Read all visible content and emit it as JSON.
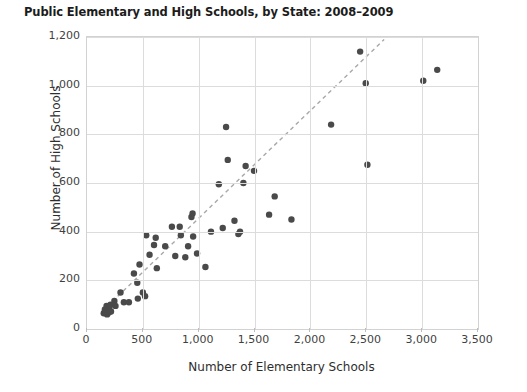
{
  "chart_data": {
    "type": "scatter",
    "title": "Public Elementary and High Schools, by State: 2008–2009",
    "xlabel": "Number of Elementary Schools",
    "ylabel": "Number of High Schools",
    "xlim": [
      0,
      3500
    ],
    "ylim": [
      0,
      1200
    ],
    "xticks": [
      0,
      500,
      1000,
      1500,
      2000,
      2500,
      3000,
      3500
    ],
    "xtick_labels": [
      "0",
      "500",
      "1,000",
      "1,500",
      "2,000",
      "2,500",
      "3,000",
      "3,500"
    ],
    "yticks": [
      0,
      200,
      400,
      600,
      800,
      1000,
      1200
    ],
    "ytick_labels": [
      "0",
      "200",
      "400",
      "600",
      "800",
      "1,000",
      "1,200"
    ],
    "grid": true,
    "legend": "none",
    "marker_color": "#4a4a4a",
    "marker_size": 6,
    "trendline": {
      "style": "dashed",
      "color": "#a8a8a8",
      "x_start": 130,
      "y_start": 70,
      "x_end": 2660,
      "y_end": 1190
    },
    "points": [
      {
        "x": 150,
        "y": 65
      },
      {
        "x": 160,
        "y": 80
      },
      {
        "x": 170,
        "y": 70
      },
      {
        "x": 175,
        "y": 95
      },
      {
        "x": 180,
        "y": 60
      },
      {
        "x": 185,
        "y": 78
      },
      {
        "x": 195,
        "y": 68
      },
      {
        "x": 200,
        "y": 90
      },
      {
        "x": 210,
        "y": 100
      },
      {
        "x": 215,
        "y": 72
      },
      {
        "x": 245,
        "y": 115
      },
      {
        "x": 255,
        "y": 95
      },
      {
        "x": 300,
        "y": 150
      },
      {
        "x": 330,
        "y": 110
      },
      {
        "x": 375,
        "y": 110
      },
      {
        "x": 420,
        "y": 228
      },
      {
        "x": 450,
        "y": 190
      },
      {
        "x": 455,
        "y": 125
      },
      {
        "x": 470,
        "y": 265
      },
      {
        "x": 500,
        "y": 150
      },
      {
        "x": 520,
        "y": 135
      },
      {
        "x": 530,
        "y": 385
      },
      {
        "x": 560,
        "y": 305
      },
      {
        "x": 600,
        "y": 345
      },
      {
        "x": 615,
        "y": 375
      },
      {
        "x": 625,
        "y": 250
      },
      {
        "x": 700,
        "y": 340
      },
      {
        "x": 760,
        "y": 420
      },
      {
        "x": 790,
        "y": 300
      },
      {
        "x": 830,
        "y": 420
      },
      {
        "x": 840,
        "y": 385
      },
      {
        "x": 880,
        "y": 295
      },
      {
        "x": 905,
        "y": 340
      },
      {
        "x": 935,
        "y": 460
      },
      {
        "x": 945,
        "y": 475
      },
      {
        "x": 950,
        "y": 380
      },
      {
        "x": 985,
        "y": 310
      },
      {
        "x": 1060,
        "y": 255
      },
      {
        "x": 1110,
        "y": 400
      },
      {
        "x": 1180,
        "y": 595
      },
      {
        "x": 1215,
        "y": 415
      },
      {
        "x": 1245,
        "y": 830
      },
      {
        "x": 1260,
        "y": 695
      },
      {
        "x": 1320,
        "y": 445
      },
      {
        "x": 1355,
        "y": 390
      },
      {
        "x": 1370,
        "y": 400
      },
      {
        "x": 1400,
        "y": 600
      },
      {
        "x": 1420,
        "y": 670
      },
      {
        "x": 1495,
        "y": 650
      },
      {
        "x": 1630,
        "y": 470
      },
      {
        "x": 1680,
        "y": 545
      },
      {
        "x": 1830,
        "y": 450
      },
      {
        "x": 2185,
        "y": 840
      },
      {
        "x": 2445,
        "y": 1140
      },
      {
        "x": 2495,
        "y": 1010
      },
      {
        "x": 2510,
        "y": 675
      },
      {
        "x": 3010,
        "y": 1020
      },
      {
        "x": 3135,
        "y": 1065
      }
    ]
  }
}
